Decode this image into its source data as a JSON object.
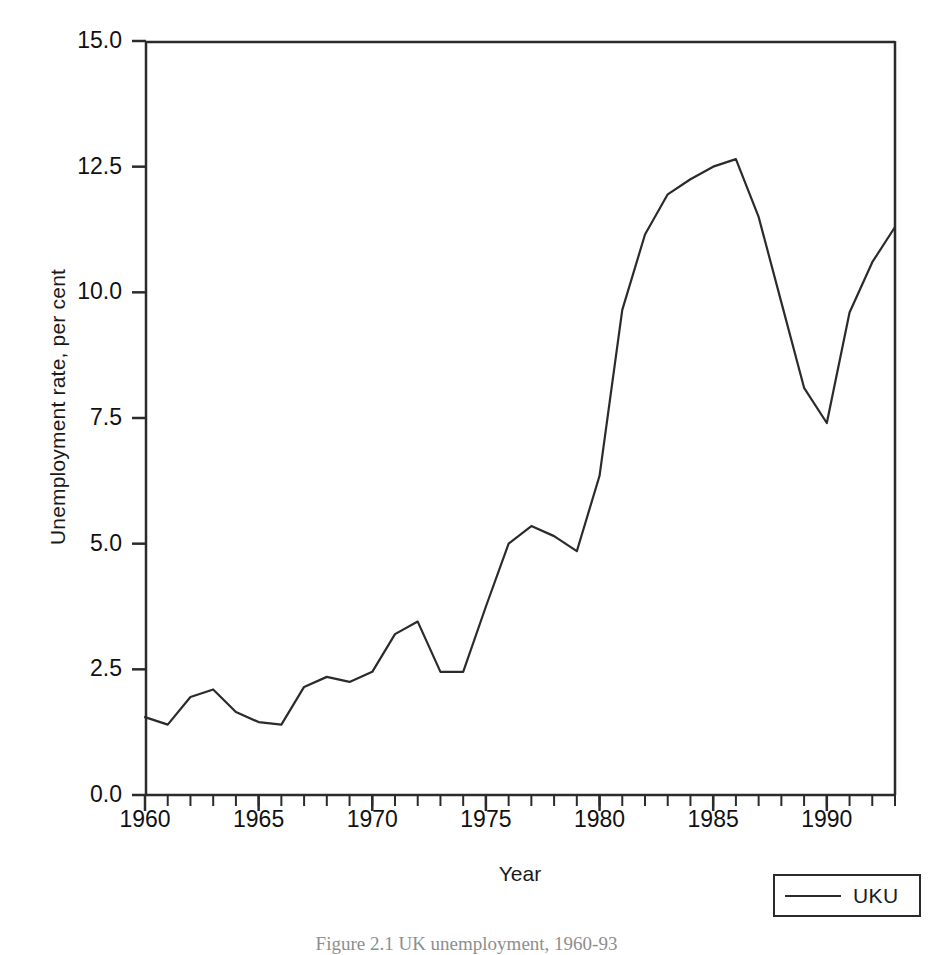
{
  "figure": {
    "caption": "Figure 2.1 UK unemployment, 1960-93"
  },
  "axes": {
    "y_title": "Unemployment rate, per cent",
    "x_title": "Year",
    "y_ticks": [
      "0.0",
      "2.5",
      "5.0",
      "7.5",
      "10.0",
      "12.5",
      "15.0"
    ],
    "x_ticks": [
      "1960",
      "1965",
      "1970",
      "1975",
      "1980",
      "1985",
      "1990"
    ]
  },
  "legend": {
    "entries": [
      {
        "label": "UKU",
        "color": "#2b2b2b",
        "style": "solid-line"
      }
    ]
  },
  "colors": {
    "line": "#2b2b2b",
    "axis": "#2b2b2b",
    "background": "#ffffff",
    "text": "#1a1a1a"
  },
  "chart_data": {
    "type": "line",
    "title": "",
    "subtitle": "",
    "xlabel": "Year",
    "ylabel": "Unemployment rate, per cent",
    "xlim": [
      1960,
      1993
    ],
    "ylim": [
      0.0,
      15.0
    ],
    "y_ticks": [
      0.0,
      2.5,
      5.0,
      7.5,
      10.0,
      12.5,
      15.0
    ],
    "x_ticks": [
      1960,
      1965,
      1970,
      1975,
      1980,
      1985,
      1990
    ],
    "x_minor_tick_interval": 1,
    "grid": false,
    "legend_position": "bottom-right",
    "x": [
      1960,
      1961,
      1962,
      1963,
      1964,
      1965,
      1966,
      1967,
      1968,
      1969,
      1970,
      1971,
      1972,
      1973,
      1974,
      1975,
      1976,
      1977,
      1978,
      1979,
      1980,
      1981,
      1982,
      1983,
      1984,
      1985,
      1986,
      1987,
      1988,
      1989,
      1990,
      1991,
      1992,
      1993
    ],
    "series": [
      {
        "name": "UKU",
        "color": "#2b2b2b",
        "values": [
          1.55,
          1.4,
          1.95,
          2.1,
          1.65,
          1.45,
          1.4,
          2.15,
          2.35,
          2.25,
          2.45,
          3.2,
          3.45,
          2.45,
          2.45,
          3.75,
          5.0,
          5.35,
          5.15,
          4.85,
          6.35,
          9.65,
          11.15,
          11.95,
          12.25,
          12.5,
          12.65,
          11.5,
          9.8,
          8.1,
          7.4,
          9.6,
          10.6,
          11.3
        ]
      }
    ]
  }
}
